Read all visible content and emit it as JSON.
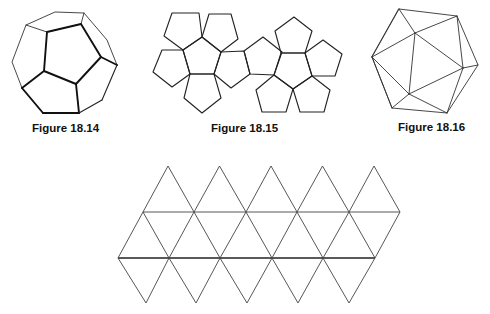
{
  "figures": [
    {
      "id": "18.14",
      "label": "Figure 18.14",
      "depicts": "dodecahedron"
    },
    {
      "id": "18.15",
      "label": "Figure 18.15",
      "depicts": "dodecahedron net"
    },
    {
      "id": "18.16",
      "label": "Figure 18.16",
      "depicts": "icosahedron"
    },
    {
      "id": "18.17",
      "label": "",
      "depicts": "icosahedron net"
    }
  ],
  "colors": {
    "line": "#222222",
    "background": "#ffffff",
    "text": "#111111"
  }
}
